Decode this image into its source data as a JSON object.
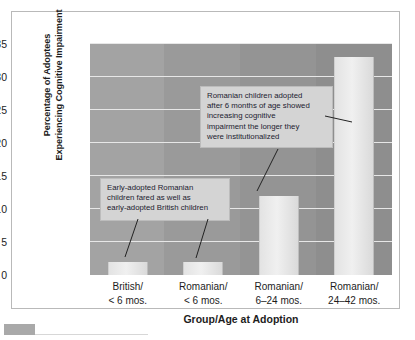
{
  "chart_data": {
    "type": "bar",
    "title": "",
    "xlabel": "Group/Age at Adoption",
    "ylabel": "Percentage of Adoptees Experiencing Cognitive Impairment",
    "ylabel_line1": "Percentage of Adoptees",
    "ylabel_line2": "Experiencing Cognitive Impairment",
    "categories": [
      "British/\n< 6 mos.",
      "Romanian/\n< 6 mos.",
      "Romanian/\n6–24 mos.",
      "Romanian/\n24–42 mos."
    ],
    "category_lines": [
      [
        "British/",
        "< 6 mos."
      ],
      [
        "Romanian/",
        "< 6 mos."
      ],
      [
        "Romanian/",
        "6–24 mos."
      ],
      [
        "Romanian/",
        "24–42 mos."
      ]
    ],
    "values": [
      2,
      2,
      12,
      33
    ],
    "ylim": [
      0,
      35
    ],
    "yticks": [
      0,
      5,
      10,
      15,
      20,
      25,
      30,
      35
    ],
    "ytick_labels": [
      "0",
      "5",
      "10",
      "15",
      "20",
      "25",
      "30",
      "35"
    ],
    "grid": true,
    "grid_axis": "y",
    "legend": "none",
    "annotations": [
      {
        "id": "callout-early",
        "lines": [
          "Early-adopted Romanian",
          "children fared as well as",
          "early-adopted British children"
        ],
        "points_to": [
          "bar-1",
          "bar-2"
        ]
      },
      {
        "id": "callout-late",
        "lines": [
          "Romanian children adopted",
          "after 6 months of age showed",
          "increasing cognitive",
          "impairment the longer they",
          "were institutionalized"
        ],
        "points_to": [
          "bar-3",
          "bar-4"
        ]
      }
    ]
  },
  "colors": {
    "plot_background": "#9b9b9b",
    "bar_fill": "#ebebeb",
    "gridline": "#e7e7e7",
    "callout_background": "#d4d4d4",
    "callout_border": "#bcbcbc",
    "text": "#1d1d1d",
    "frame_border": "#b9b9b9",
    "page_background": "#ffffff",
    "footer_swatch": "#a9a9a9"
  }
}
